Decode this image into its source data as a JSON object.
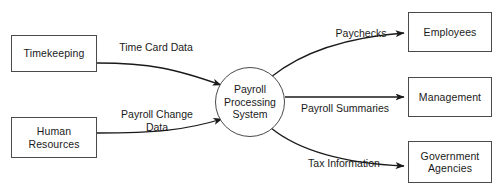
{
  "diagram": {
    "type": "data-flow-diagram",
    "canvas": {
      "width": 502,
      "height": 194
    },
    "colors": {
      "background": "#ffffff",
      "stroke": "#4a4a4a",
      "arrow": "#1a1a1a",
      "text": "#1a1a1a"
    },
    "process": {
      "id": "payroll-processing-system",
      "shape": "circle",
      "label": "Payroll\nProcessing\nSystem",
      "center_x": 250,
      "center_y": 102,
      "radius": 35
    },
    "external_entities": [
      {
        "id": "timekeeping",
        "label": "Timekeeping",
        "role": "source",
        "x": 11,
        "y": 35,
        "width": 86,
        "height": 37
      },
      {
        "id": "human-resources",
        "label": "Human\nResources",
        "role": "source",
        "x": 11,
        "y": 117,
        "width": 86,
        "height": 41
      },
      {
        "id": "employees",
        "label": "Employees",
        "role": "sink",
        "x": 408,
        "y": 12,
        "width": 84,
        "height": 40
      },
      {
        "id": "management",
        "label": "Management",
        "role": "sink",
        "x": 408,
        "y": 77,
        "width": 84,
        "height": 40
      },
      {
        "id": "government-agencies",
        "label": "Government\nAgencies",
        "role": "sink",
        "x": 408,
        "y": 141,
        "width": 84,
        "height": 42
      }
    ],
    "data_flows": [
      {
        "id": "time-card-data",
        "label": "Time Card Data",
        "from": "timekeeping",
        "to": "payroll-processing-system",
        "label_x": 110,
        "label_y": 41,
        "path": "M 97 63 C 150 63 175 68 222 85",
        "arrow_angle_deg": 20
      },
      {
        "id": "payroll-change-data",
        "label": "Payroll Change\nData",
        "from": "human-resources",
        "to": "payroll-processing-system",
        "label_x": 107,
        "label_y": 108,
        "path": "M 97 133 C 155 133 185 130 222 119",
        "arrow_angle_deg": -18
      },
      {
        "id": "paychecks",
        "label": "Paychecks",
        "from": "payroll-processing-system",
        "to": "employees",
        "label_x": 332,
        "label_y": 27,
        "path": "M 272 76 C 300 58 340 40 405 33",
        "arrow_angle_deg": -6
      },
      {
        "id": "payroll-summaries",
        "label": "Payroll Summaries",
        "from": "payroll-processing-system",
        "to": "management",
        "label_x": 298,
        "label_y": 103,
        "path": "M 285 97 L 405 97",
        "arrow_angle_deg": 0
      },
      {
        "id": "tax-information",
        "label": "Tax Information",
        "from": "payroll-processing-system",
        "to": "government-agencies",
        "label_x": 304,
        "label_y": 157,
        "path": "M 272 129 C 300 148 340 162 405 165",
        "arrow_angle_deg": 4
      }
    ]
  }
}
